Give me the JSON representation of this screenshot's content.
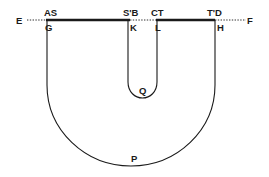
{
  "figure": {
    "type": "geometric-diagram",
    "colors": {
      "ink": "#1a1a1a",
      "background": "#ffffff"
    },
    "labels": {
      "E": "E",
      "AS": "AS",
      "G": "G",
      "SB": "S'B",
      "K": "K",
      "CT": "CT",
      "L": "L",
      "TD": "T'D",
      "H": "H",
      "F": "F",
      "Q": "Q",
      "P": "P"
    },
    "segments": [
      {
        "name": "E-A",
        "style": "dotted"
      },
      {
        "name": "A-B",
        "style": "thick"
      },
      {
        "name": "B-C",
        "style": "dotted"
      },
      {
        "name": "C-D",
        "style": "thick"
      },
      {
        "name": "D-F",
        "style": "dotted"
      }
    ],
    "curves": [
      {
        "name": "outer-U",
        "through": [
          "G",
          "P",
          "H"
        ]
      },
      {
        "name": "inner-U",
        "through": [
          "K",
          "Q",
          "L"
        ]
      }
    ]
  }
}
